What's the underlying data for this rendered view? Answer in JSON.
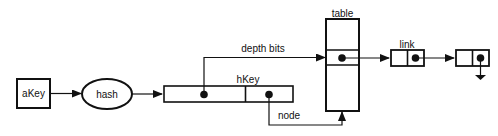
{
  "diagram": {
    "nodes": {
      "akey": {
        "label": "aKey"
      },
      "hash": {
        "label": "hash"
      },
      "hkey": {
        "label": "hKey"
      },
      "table": {
        "label": "table"
      },
      "link": {
        "label": "link"
      }
    },
    "edges": {
      "depth_bits": {
        "label": "depth bits"
      },
      "node": {
        "label": "node"
      }
    },
    "colors": {
      "stroke": "#111111",
      "background": "#ffffff"
    }
  }
}
